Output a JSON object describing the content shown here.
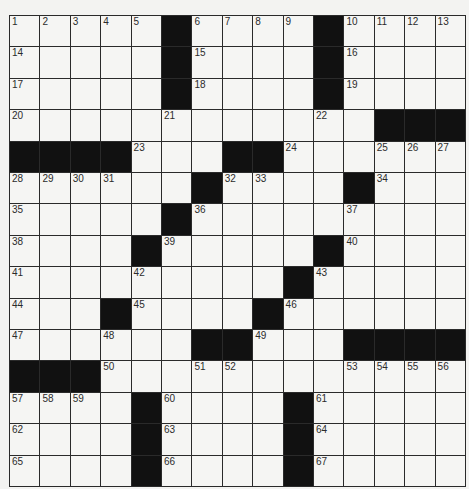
{
  "puzzle": {
    "rows": 15,
    "cols": 15,
    "colors": {
      "background": "#f3f3f1",
      "cell": "#f5f5f3",
      "block": "#111111",
      "line": "#2a2a2a",
      "number": "#2b2b2b"
    },
    "layout": [
      "1,2,3,4,5,#,6,7,8,9,#,10,11,12,13",
      "14,.,.,.,.,#,15,.,.,.,#,16,.,.,.",
      "17,.,.,.,.,#,18,.,.,.,#,19,.,.,.",
      "20,.,.,.,.,21,.,.,.,.,22,.,#,#,#",
      "#,#,#,#,23,.,.,#,#,24,.,.,25,26,27",
      "28,29,30,31,.,.,#,32,33,.,.,#,34,.,.",
      "35,.,.,.,.,#,36,.,.,.,.,37,.,.,.",
      "38,.,.,.,#,39,.,.,.,.,#,40,.,.,.",
      "41,.,.,.,42,.,.,.,.,#,43,.,.,.,.",
      "44,.,.,#,45,.,.,.,#,46,.,.,.,.,.",
      "47,.,.,48,.,.,#,#,49,.,.,#,#,#,#",
      "#,#,#,50,.,.,51,52,.,.,.,53,54,55,56",
      "57,58,59,.,#,60,.,.,.,#,61,.,.,.,.",
      "62,.,.,.,#,63,.,.,.,#,64,.,.,.,.",
      "65,.,.,.,#,66,.,.,.,#,67,.,.,.,."
    ]
  }
}
